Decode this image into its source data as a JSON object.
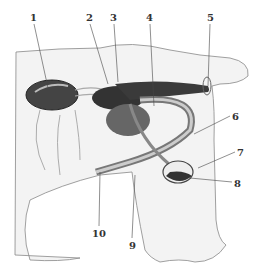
{
  "diagram": {
    "type": "anatomical-illustration",
    "labels": [
      {
        "id": "1",
        "text": "1",
        "x": 30,
        "y": 13
      },
      {
        "id": "2",
        "text": "2",
        "x": 86,
        "y": 13
      },
      {
        "id": "3",
        "text": "3",
        "x": 110,
        "y": 13
      },
      {
        "id": "4",
        "text": "4",
        "x": 146,
        "y": 13
      },
      {
        "id": "5",
        "text": "5",
        "x": 207,
        "y": 13
      },
      {
        "id": "6",
        "text": "6",
        "x": 232,
        "y": 112
      },
      {
        "id": "7",
        "text": "7",
        "x": 237,
        "y": 148
      },
      {
        "id": "8",
        "text": "8",
        "x": 234,
        "y": 179
      },
      {
        "id": "9",
        "text": "9",
        "x": 129,
        "y": 241
      },
      {
        "id": "10",
        "text": "10",
        "x": 92,
        "y": 229
      }
    ]
  }
}
